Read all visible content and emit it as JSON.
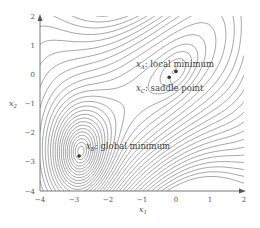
{
  "chart_data": {
    "type": "contour",
    "title": "",
    "xlabel": "x1",
    "ylabel": "x2",
    "xlim": [
      -4,
      2
    ],
    "ylim": [
      -4,
      2
    ],
    "xticks": [
      "-4",
      "-3",
      "-2",
      "-1",
      "0",
      "1",
      "2"
    ],
    "yticks": [
      "2",
      "1",
      "0",
      "-1",
      "-2",
      "-3",
      "-4"
    ],
    "xtick_values": [
      -4,
      -3,
      -2,
      -1,
      0,
      1,
      2
    ],
    "ytick_values": [
      2,
      1,
      0,
      -1,
      -2,
      -3,
      -4
    ],
    "grid": false,
    "legend": "none",
    "points": [
      {
        "name": "x_A",
        "label": "x_A: local minimum",
        "x": 0.0,
        "y": 0.1,
        "style": "filled"
      },
      {
        "name": "x_C",
        "label": "x_C: saddle point",
        "x": -0.2,
        "y": -0.1,
        "style": "filled"
      },
      {
        "name": "x_B",
        "label": "x_B: global minimum",
        "x": -2.85,
        "y": -2.8,
        "style": "filled"
      }
    ],
    "annotations": [
      {
        "text_main": "x",
        "sub": "A",
        "rest": ": local minimum"
      },
      {
        "text_main": "x",
        "sub": "C",
        "rest": ": saddle point"
      },
      {
        "text_main": "x",
        "sub": "B",
        "rest": ": global minimum"
      }
    ],
    "contour_levels": 34
  },
  "axes": {
    "xlabel_main": "x",
    "xlabel_sub": "1",
    "ylabel_main": "x",
    "ylabel_sub": "2"
  }
}
